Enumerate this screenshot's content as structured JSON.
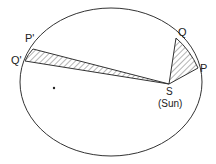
{
  "diagram": {
    "labels": {
      "p_prime": "P'",
      "q_prime": "Q'",
      "q": "Q",
      "p": "P",
      "s": "S",
      "sun": "(Sun)"
    },
    "colors": {
      "stroke": "#333333",
      "background": "#ffffff"
    }
  }
}
